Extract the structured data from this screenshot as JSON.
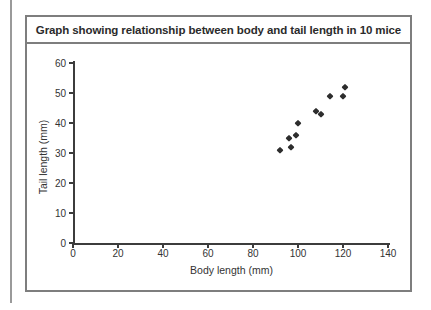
{
  "page": {
    "background": "#ffffff",
    "edge_line_color": "#9a9a9a"
  },
  "figure": {
    "title": "Graph showing relationship between body and tail length in 10 mice",
    "border_color": "#7e7e7e"
  },
  "chart_data": {
    "type": "scatter",
    "title": "Graph showing relationship between body and tail length in 10 mice",
    "xlabel": "Body length (mm)",
    "ylabel": "Tail length (mm)",
    "xlim": [
      0,
      140
    ],
    "ylim": [
      0,
      60
    ],
    "x_ticks": [
      0,
      20,
      40,
      60,
      80,
      100,
      120,
      140
    ],
    "y_ticks": [
      0,
      10,
      20,
      30,
      40,
      50,
      60
    ],
    "grid": false,
    "legend": false,
    "marker": "diamond",
    "marker_color": "#2d2d2d",
    "axis_color": "#3c3c3c",
    "points": [
      {
        "body_mm": 92,
        "tail_mm": 31
      },
      {
        "body_mm": 96,
        "tail_mm": 35
      },
      {
        "body_mm": 97,
        "tail_mm": 32
      },
      {
        "body_mm": 99,
        "tail_mm": 36
      },
      {
        "body_mm": 100,
        "tail_mm": 40
      },
      {
        "body_mm": 108,
        "tail_mm": 44
      },
      {
        "body_mm": 110,
        "tail_mm": 43
      },
      {
        "body_mm": 114,
        "tail_mm": 49
      },
      {
        "body_mm": 120,
        "tail_mm": 49
      },
      {
        "body_mm": 121,
        "tail_mm": 52
      }
    ]
  }
}
